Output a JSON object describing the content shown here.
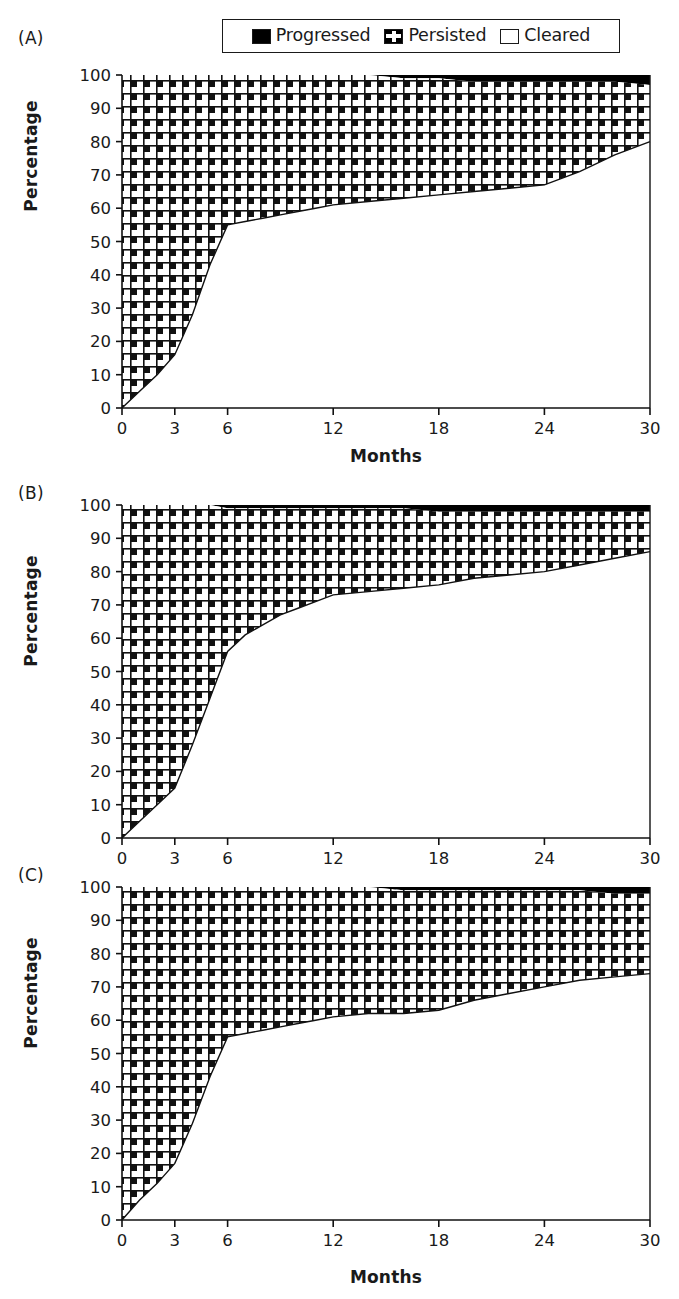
{
  "legend": {
    "entries": [
      {
        "label": "Progressed",
        "icon": "black-square-swatch",
        "color": "#000000"
      },
      {
        "label": "Persisted",
        "icon": "checkered-square-swatch",
        "color": "#000000"
      },
      {
        "label": "Cleared",
        "icon": "white-square-swatch",
        "color": "#ffffff"
      }
    ]
  },
  "panels": [
    {
      "label": "(A)",
      "xlabel": "Months",
      "ylabel": "Percentage"
    },
    {
      "label": "(B)",
      "xlabel": "Months",
      "ylabel": "Percentage"
    },
    {
      "label": "(C)",
      "xlabel": "Months",
      "ylabel": "Percentage"
    }
  ],
  "axis": {
    "y_ticks": [
      "0",
      "10",
      "20",
      "30",
      "40",
      "50",
      "60",
      "70",
      "80",
      "90",
      "100"
    ],
    "x_ticks": [
      "0",
      "3",
      "6",
      "12",
      "18",
      "24",
      "30"
    ]
  },
  "chart_data": [
    {
      "type": "area",
      "panel": "(A)",
      "title": "",
      "xlabel": "Months",
      "ylabel": "Percentage",
      "xlim": [
        0,
        30
      ],
      "ylim": [
        0,
        100
      ],
      "xticks": [
        0,
        3,
        6,
        12,
        18,
        24,
        30
      ],
      "yticks": [
        0,
        10,
        20,
        30,
        40,
        50,
        60,
        70,
        80,
        90,
        100
      ],
      "grid": false,
      "stacked": true,
      "legend_position": "top-center",
      "x": [
        0,
        1,
        2,
        3,
        4,
        5,
        6,
        7,
        8,
        9,
        10,
        11,
        12,
        14,
        16,
        18,
        20,
        22,
        24,
        26,
        28,
        30
      ],
      "series": [
        {
          "name": "Cleared",
          "values": [
            0,
            5,
            10,
            16,
            28,
            43,
            55,
            56,
            57,
            58,
            59,
            60,
            61,
            62,
            63,
            64,
            65,
            66,
            67,
            71,
            76,
            80
          ]
        },
        {
          "name": "Persisted",
          "values": [
            100,
            95,
            90,
            84,
            72,
            57,
            45,
            44,
            43,
            42,
            41,
            40,
            39,
            38,
            36,
            35,
            33,
            32,
            31,
            27,
            22,
            17
          ]
        },
        {
          "name": "Progressed",
          "values": [
            0,
            0,
            0,
            0,
            0,
            0,
            0,
            0,
            0,
            0,
            0,
            0,
            0,
            0,
            1,
            1,
            2,
            2,
            2,
            2,
            2,
            3
          ]
        }
      ],
      "cumulative_cleared_plus_persisted": [
        100,
        100,
        100,
        100,
        100,
        100,
        100,
        100,
        100,
        100,
        100,
        100,
        100,
        100,
        99,
        99,
        98,
        98,
        98,
        98,
        98,
        97
      ]
    },
    {
      "type": "area",
      "panel": "(B)",
      "title": "",
      "xlabel": "Months",
      "ylabel": "Percentage",
      "xlim": [
        0,
        30
      ],
      "ylim": [
        0,
        100
      ],
      "xticks": [
        0,
        3,
        6,
        12,
        18,
        24,
        30
      ],
      "yticks": [
        0,
        10,
        20,
        30,
        40,
        50,
        60,
        70,
        80,
        90,
        100
      ],
      "grid": false,
      "stacked": true,
      "legend_position": "top-center",
      "x": [
        0,
        1,
        2,
        3,
        4,
        5,
        6,
        7,
        8,
        9,
        10,
        11,
        12,
        14,
        16,
        18,
        20,
        22,
        24,
        26,
        28,
        30
      ],
      "series": [
        {
          "name": "Cleared",
          "values": [
            0,
            5,
            10,
            15,
            28,
            42,
            56,
            61,
            64,
            67,
            69,
            71,
            73,
            74,
            75,
            76,
            78,
            79,
            80,
            82,
            84,
            86
          ]
        },
        {
          "name": "Persisted",
          "values": [
            100,
            95,
            90,
            85,
            72,
            58,
            43,
            38,
            35,
            32,
            30,
            28,
            26,
            25,
            24,
            22,
            20,
            19,
            18,
            16,
            14,
            12
          ]
        },
        {
          "name": "Progressed",
          "values": [
            0,
            0,
            0,
            0,
            0,
            0,
            1,
            1,
            1,
            1,
            1,
            1,
            1,
            1,
            1,
            2,
            2,
            2,
            2,
            2,
            2,
            2
          ]
        }
      ],
      "cumulative_cleared_plus_persisted": [
        100,
        100,
        100,
        100,
        100,
        100,
        99,
        99,
        99,
        99,
        99,
        99,
        99,
        99,
        99,
        98,
        98,
        98,
        98,
        98,
        98,
        98
      ]
    },
    {
      "type": "area",
      "panel": "(C)",
      "title": "",
      "xlabel": "Months",
      "ylabel": "Percentage",
      "xlim": [
        0,
        30
      ],
      "ylim": [
        0,
        100
      ],
      "xticks": [
        0,
        3,
        6,
        12,
        18,
        24,
        30
      ],
      "yticks": [
        0,
        10,
        20,
        30,
        40,
        50,
        60,
        70,
        80,
        90,
        100
      ],
      "grid": false,
      "stacked": true,
      "legend_position": "top-center",
      "x": [
        0,
        1,
        2,
        3,
        4,
        5,
        6,
        7,
        8,
        9,
        10,
        11,
        12,
        14,
        16,
        18,
        20,
        22,
        24,
        26,
        28,
        30
      ],
      "series": [
        {
          "name": "Cleared",
          "values": [
            0,
            6,
            11,
            17,
            29,
            43,
            55,
            56,
            57,
            58,
            59,
            60,
            61,
            62,
            62,
            63,
            66,
            68,
            70,
            72,
            73,
            74
          ]
        },
        {
          "name": "Persisted",
          "values": [
            100,
            94,
            89,
            83,
            71,
            57,
            45,
            44,
            43,
            42,
            41,
            40,
            39,
            38,
            37,
            36,
            33,
            31,
            29,
            27,
            25,
            24
          ]
        },
        {
          "name": "Progressed",
          "values": [
            0,
            0,
            0,
            0,
            0,
            0,
            0,
            0,
            0,
            0,
            0,
            0,
            0,
            0,
            1,
            1,
            1,
            1,
            1,
            1,
            2,
            2
          ]
        }
      ],
      "cumulative_cleared_plus_persisted": [
        100,
        100,
        100,
        100,
        100,
        100,
        100,
        100,
        100,
        100,
        100,
        100,
        100,
        100,
        99,
        99,
        99,
        99,
        99,
        99,
        98,
        98
      ]
    }
  ]
}
